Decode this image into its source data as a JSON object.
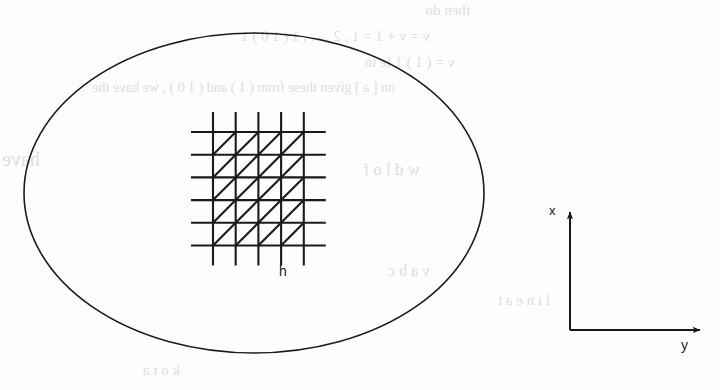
{
  "figure": {
    "caption_label": "",
    "domain_shape": "ellipse",
    "ink_color": "#1a1a1a",
    "paper_color": "#fdfdfd",
    "ghost_color": "#d9d9dd"
  },
  "labels": {
    "grid_spacing": "h",
    "axis_vertical": "x",
    "axis_horizontal": "y"
  },
  "geometry": {
    "ellipse": {
      "cx": 254,
      "cy": 193,
      "rx": 230,
      "ry": 160,
      "stroke_width": 1.6
    },
    "mesh": {
      "origin_x": 213,
      "origin_y": 132,
      "spacing": 22.7,
      "vertical_count": 5,
      "horizontal_count": 6,
      "vertical_overhang": 20,
      "horizontal_overhang": 22,
      "stroke_width": 2.1,
      "diagonal_direction": "sw-ne"
    },
    "axes": {
      "origin_x": 570,
      "origin_y": 330,
      "x_axis_top": 212,
      "y_axis_right": 700,
      "stroke_width": 2.0,
      "arrow_size": 7
    }
  },
  "ghost_text": [
    {
      "text": "then do",
      "left": 470,
      "top": 2,
      "size": 15
    },
    {
      "text": "v = v + 1  = 1 , 2 , ... , 1 ( 1 0 ) 1",
      "left": 430,
      "top": 28,
      "size": 15
    },
    {
      "text": "v = ( 1 ) 1  Ie tu",
      "left": 455,
      "top": 54,
      "size": 15
    },
    {
      "text": "on [ a ] given these from ( 1 ) and ( 1 0 ) , we have the",
      "left": 395,
      "top": 80,
      "size": 14
    },
    {
      "text": "have the",
      "left": 40,
      "top": 148,
      "size": 20
    },
    {
      "text": "w d l  o f",
      "left": 420,
      "top": 160,
      "size": 17
    },
    {
      "text": "v a b c",
      "left": 430,
      "top": 262,
      "size": 16
    },
    {
      "text": "l i n e  a t",
      "left": 550,
      "top": 292,
      "size": 15
    },
    {
      "text": "k o t a",
      "left": 180,
      "top": 362,
      "size": 15
    }
  ]
}
